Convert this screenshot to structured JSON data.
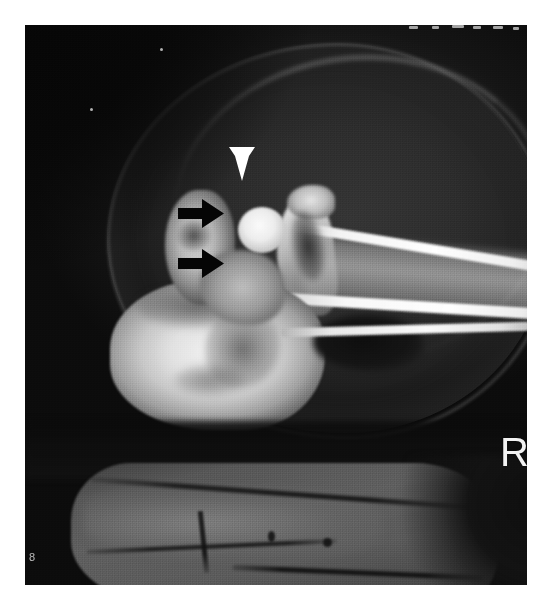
{
  "image": {
    "modality": "radiograph",
    "view_label": "R",
    "corner_id": "8",
    "background_color": "#0c0c0c",
    "border_color": "#ffffff",
    "width": 541,
    "height": 611
  },
  "annotations": {
    "arrowhead": {
      "name": "white-arrowhead",
      "color": "#ffffff",
      "direction": "down",
      "x": 229,
      "y": 147
    },
    "arrows": [
      {
        "name": "black-arrow-upper",
        "color": "#000000",
        "direction": "right",
        "x": 178,
        "y": 199
      },
      {
        "name": "black-arrow-lower",
        "color": "#000000",
        "direction": "right",
        "x": 178,
        "y": 249
      }
    ]
  },
  "film_marks": {
    "top_ticks": [
      {
        "x": 409,
        "y": 26,
        "w": 9
      },
      {
        "x": 432,
        "y": 26,
        "w": 7
      },
      {
        "x": 452,
        "y": 25,
        "w": 12
      },
      {
        "x": 473,
        "y": 26,
        "w": 8
      },
      {
        "x": 493,
        "y": 26,
        "w": 10
      },
      {
        "x": 513,
        "y": 27,
        "w": 6
      }
    ],
    "flecks": [
      {
        "x": 160,
        "y": 48
      },
      {
        "x": 90,
        "y": 108
      }
    ]
  }
}
